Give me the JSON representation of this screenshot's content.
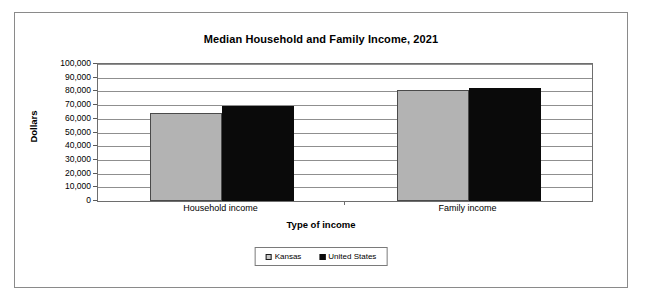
{
  "chart_data": {
    "type": "bar",
    "title": "Median Household and Family Income, 2021",
    "xlabel": "Type of income",
    "ylabel": "Dollars",
    "categories": [
      "Household income",
      "Family income"
    ],
    "series": [
      {
        "name": "Kansas",
        "color": "#b3b3b3",
        "values": [
          64500,
          81000
        ]
      },
      {
        "name": "United States",
        "color": "#0a0a0a",
        "values": [
          69700,
          82800
        ]
      }
    ],
    "ylim": [
      0,
      100000
    ],
    "ytick_labels": [
      "100,000",
      "90,000",
      "80,000",
      "70,000",
      "60,000",
      "50,000",
      "40,000",
      "30,000",
      "20,000",
      "10,000",
      "0"
    ],
    "ytick_values": [
      100000,
      90000,
      80000,
      70000,
      60000,
      50000,
      40000,
      30000,
      20000,
      10000,
      0
    ],
    "grid": true,
    "legend_position": "bottom-center",
    "legend_entries": [
      "Kansas",
      "United States"
    ]
  }
}
